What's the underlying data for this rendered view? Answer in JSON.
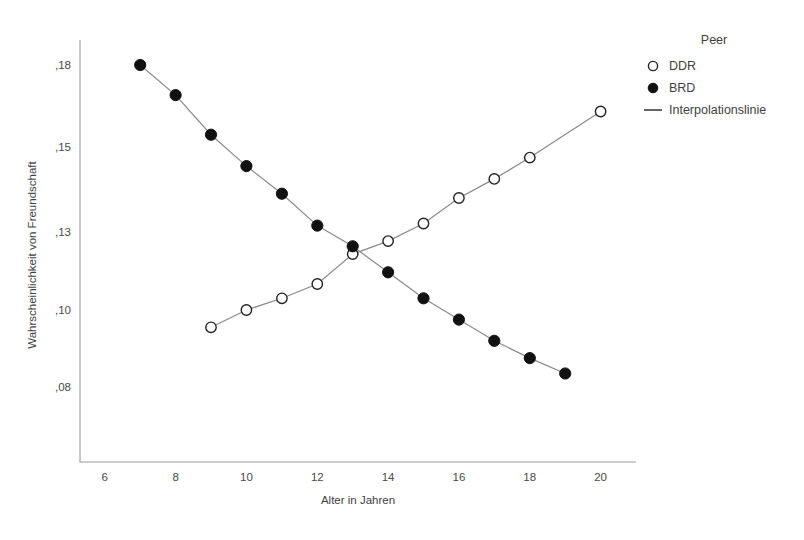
{
  "chart_data": {
    "type": "line",
    "title": "",
    "xlabel": "Alter in Jahren",
    "ylabel": "Wahrscheinlichkeit von Freundschaft",
    "xlim": [
      5.3,
      21.0
    ],
    "ylim": [
      0.066,
      0.193
    ],
    "grid": false,
    "legend_position": "right-top",
    "legend_title": "Peer",
    "xticks": [
      6,
      8,
      10,
      12,
      14,
      16,
      18,
      20
    ],
    "xtick_labels": [
      "6",
      "8",
      "10",
      "12",
      "14",
      "16",
      "18",
      "20"
    ],
    "yticks": [
      0.18,
      0.15,
      0.13,
      0.1,
      0.08
    ],
    "ytick_labels": [
      ",18",
      ",15",
      ",13",
      ",10",
      ",08"
    ],
    "series": [
      {
        "name": "DDR",
        "marker": "open-circle",
        "x": [
          9,
          10,
          11,
          12,
          13,
          14,
          15,
          16,
          17,
          18,
          20
        ],
        "values": [
          0.0955,
          0.1,
          0.1045,
          0.11,
          0.1215,
          0.1265,
          0.132,
          0.138,
          0.1425,
          0.1475,
          0.163
        ]
      },
      {
        "name": "BRD",
        "marker": "filled-circle",
        "x": [
          7,
          8,
          9,
          10,
          11,
          12,
          13,
          14,
          15,
          16,
          17,
          18,
          19
        ],
        "values": [
          0.18,
          0.169,
          0.1545,
          0.1455,
          0.139,
          0.1315,
          0.1245,
          0.1145,
          0.1045,
          0.0975,
          0.092,
          0.0875,
          0.0835
        ]
      }
    ],
    "legend_entries": [
      {
        "label": "DDR",
        "marker": "open-circle"
      },
      {
        "label": "BRD",
        "marker": "filled-circle"
      },
      {
        "label": "Interpolationslinie",
        "marker": "line"
      }
    ]
  }
}
